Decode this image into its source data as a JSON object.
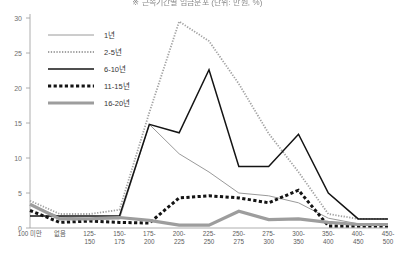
{
  "chart": {
    "title": "※ 근속기간별 임금분포 (단위: 만원, %)",
    "ylabel": "",
    "xlabel": ""
  },
  "legend": {
    "position": "top-left",
    "items": [
      {
        "label": "1년",
        "style": "thin-solid-gray",
        "color": "#9a9a9a"
      },
      {
        "label": "2-5년",
        "style": "fine-dotted-gray",
        "color": "#9a9a9a"
      },
      {
        "label": "6-10년",
        "style": "solid-black",
        "color": "#1a1a1a"
      },
      {
        "label": "11-15년",
        "style": "thick-dashed-black",
        "color": "#1a1a1a"
      },
      {
        "label": "16-20년",
        "style": "thick-solid-gray",
        "color": "#9d9d9d"
      }
    ]
  },
  "chart_data": {
    "type": "line",
    "title": "※ 근속기간별 임금분포 (단위: 만원, %)",
    "xlabel": "",
    "ylabel": "",
    "ylim": [
      0,
      30
    ],
    "yticks": [
      0,
      5,
      10,
      15,
      20,
      25,
      30
    ],
    "ytick_labels": [
      "0",
      "5",
      "10",
      "15",
      "20",
      "25",
      "30"
    ],
    "grid": false,
    "categories": [
      "100 미만",
      "없음",
      "125-\n150",
      "150-\n175",
      "175-\n200",
      "200-\n225",
      "225-\n250",
      "250-\n275",
      "275-\n300",
      "300-\n350",
      "350-\n400",
      "400-\n450",
      "450-\n500"
    ],
    "categories_flat": [
      "100 미만",
      "없음",
      "125-150",
      "150-175",
      "175-200",
      "200-225",
      "225-250",
      "250-275",
      "275-300",
      "300-350",
      "350-400",
      "400-450",
      "450-500"
    ],
    "series": [
      {
        "name": "1년",
        "color": "#9a9a9a",
        "width": 1.0,
        "dash": "none",
        "values": [
          3.3,
          1.6,
          1.3,
          1.3,
          14.8,
          10.6,
          8.0,
          5.0,
          4.6,
          3.6,
          1.4,
          0.6,
          0.6
        ]
      },
      {
        "name": "2-5년",
        "color": "#a2a2a2",
        "width": 1.8,
        "dash": "dotted-fine",
        "values": [
          3.9,
          2.0,
          2.0,
          2.6,
          16.5,
          29.5,
          26.7,
          20.6,
          13.5,
          8.0,
          2.0,
          1.3,
          1.3
        ]
      },
      {
        "name": "6-10년",
        "color": "#141414",
        "width": 1.5,
        "dash": "none",
        "values": [
          1.7,
          1.7,
          1.7,
          1.7,
          14.8,
          13.6,
          22.6,
          8.8,
          8.8,
          13.4,
          5.0,
          1.3,
          1.3
        ]
      },
      {
        "name": "11-15년",
        "color": "#141414",
        "width": 3.0,
        "dash": "dashed-thick",
        "values": [
          2.5,
          0.8,
          1.0,
          0.8,
          0.7,
          4.3,
          4.6,
          4.3,
          3.6,
          5.4,
          0.3,
          0.3,
          0.3
        ]
      },
      {
        "name": "16-20년",
        "color": "#9d9d9d",
        "width": 3.2,
        "dash": "none",
        "values": [
          3.4,
          1.3,
          1.3,
          1.5,
          1.1,
          0.4,
          0.4,
          2.4,
          1.2,
          1.3,
          0.8,
          0.5,
          0.5
        ]
      }
    ]
  }
}
